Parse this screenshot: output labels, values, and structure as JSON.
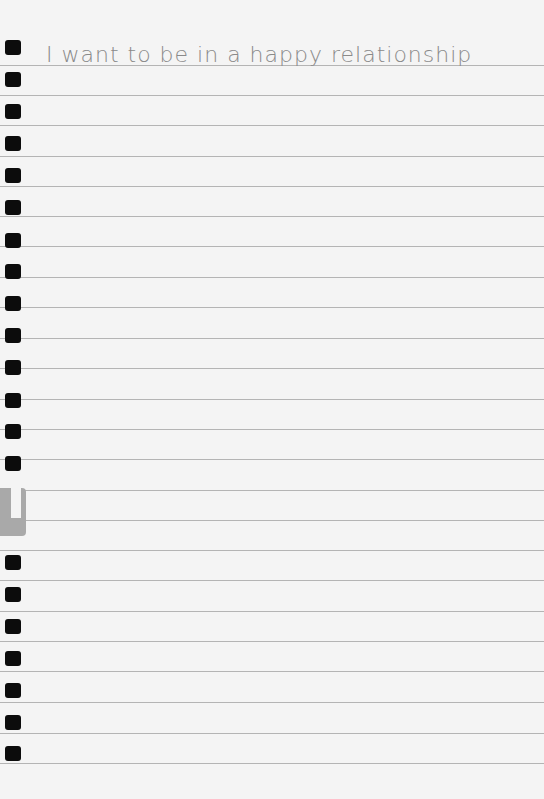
{
  "page": {
    "type": "lined notebook paper",
    "handwritten_line": "I want to be in a happy relationship",
    "ruled_lines_count": 23,
    "punch_holes_count": 23,
    "colors": {
      "paper": "#f4f4f4",
      "rule": "#b4b4b4",
      "hole": "#0c0c0c",
      "ink": "#8a8a8a",
      "tab": "#a9a9a9"
    }
  }
}
